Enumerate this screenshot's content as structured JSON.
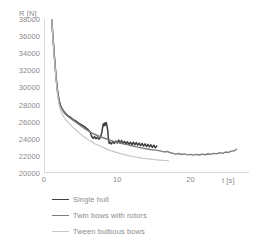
{
  "chart_data": {
    "type": "line",
    "title": "",
    "xlabel": "t [s]",
    "ylabel": "R [N]",
    "xlim": [
      0,
      28
    ],
    "ylim": [
      20000,
      38000
    ],
    "xticks": [
      0,
      10,
      20
    ],
    "yticks": [
      20000,
      22000,
      24000,
      26000,
      28000,
      30000,
      32000,
      34000,
      36000,
      38000
    ],
    "ytick_labels": [
      "20000",
      "22000",
      "24000",
      "26000",
      "28000",
      "30000",
      "32000",
      "34000",
      "36000",
      "38000"
    ],
    "xtick_labels": [
      "0",
      "10",
      "20"
    ],
    "grid": false,
    "legend_position": "bottom-left",
    "series": [
      {
        "name": "Single hull",
        "color": "#3f3f3f",
        "width": 1.5,
        "points": [
          [
            1.05,
            38000
          ],
          [
            1.25,
            35600
          ],
          [
            1.45,
            33300
          ],
          [
            1.65,
            31200
          ],
          [
            1.85,
            29600
          ],
          [
            2.05,
            28500
          ],
          [
            2.3,
            27800
          ],
          [
            2.6,
            27350
          ],
          [
            2.9,
            27000
          ],
          [
            3.2,
            26750
          ],
          [
            3.6,
            26500
          ],
          [
            4.0,
            26250
          ],
          [
            4.4,
            26050
          ],
          [
            4.8,
            25800
          ],
          [
            5.2,
            25600
          ],
          [
            5.6,
            25350
          ],
          [
            6.0,
            25100
          ],
          [
            6.3,
            24800
          ],
          [
            6.5,
            24300
          ],
          [
            6.7,
            24050
          ],
          [
            6.9,
            24250
          ],
          [
            7.1,
            24000
          ],
          [
            7.3,
            24200
          ],
          [
            7.5,
            23950
          ],
          [
            7.7,
            24150
          ],
          [
            7.9,
            24750
          ],
          [
            8.0,
            25300
          ],
          [
            8.1,
            25750
          ],
          [
            8.2,
            25500
          ],
          [
            8.3,
            25850
          ],
          [
            8.4,
            25600
          ],
          [
            8.5,
            25900
          ],
          [
            8.6,
            25500
          ],
          [
            8.7,
            25000
          ],
          [
            8.8,
            24000
          ],
          [
            8.9,
            23450
          ],
          [
            9.0,
            23600
          ],
          [
            9.2,
            23400
          ],
          [
            9.4,
            23700
          ],
          [
            9.6,
            23450
          ],
          [
            9.8,
            23750
          ],
          [
            10.0,
            23500
          ],
          [
            10.2,
            23850
          ],
          [
            10.4,
            23500
          ],
          [
            10.6,
            23800
          ],
          [
            10.8,
            23450
          ],
          [
            11.0,
            23700
          ],
          [
            11.2,
            23400
          ],
          [
            11.4,
            23650
          ],
          [
            11.6,
            23350
          ],
          [
            11.8,
            23600
          ],
          [
            12.0,
            23300
          ],
          [
            12.2,
            23600
          ],
          [
            12.4,
            23300
          ],
          [
            12.6,
            23550
          ],
          [
            12.8,
            23250
          ],
          [
            13.0,
            23500
          ],
          [
            13.2,
            23200
          ],
          [
            13.4,
            23450
          ],
          [
            13.6,
            23150
          ],
          [
            13.8,
            23400
          ],
          [
            14.0,
            23100
          ],
          [
            14.2,
            23350
          ],
          [
            14.4,
            23050
          ],
          [
            14.6,
            23300
          ],
          [
            14.8,
            23000
          ],
          [
            15.0,
            23250
          ],
          [
            15.2,
            22950
          ],
          [
            15.4,
            23150
          ]
        ]
      },
      {
        "name": "Twin bows with rotors",
        "color": "#7d7d7d",
        "width": 1.4,
        "points": [
          [
            1.05,
            38000
          ],
          [
            1.25,
            35500
          ],
          [
            1.45,
            33200
          ],
          [
            1.65,
            31100
          ],
          [
            1.85,
            29500
          ],
          [
            2.05,
            28400
          ],
          [
            2.3,
            27700
          ],
          [
            2.6,
            27250
          ],
          [
            2.9,
            26900
          ],
          [
            3.2,
            26650
          ],
          [
            3.6,
            26400
          ],
          [
            4.0,
            26150
          ],
          [
            4.4,
            25900
          ],
          [
            4.8,
            25650
          ],
          [
            5.2,
            25400
          ],
          [
            5.6,
            25150
          ],
          [
            6.0,
            24950
          ],
          [
            6.5,
            24700
          ],
          [
            7.0,
            24500
          ],
          [
            7.5,
            24300
          ],
          [
            8.0,
            24150
          ],
          [
            8.5,
            24000
          ],
          [
            9.0,
            23850
          ],
          [
            9.5,
            23700
          ],
          [
            10.0,
            23600
          ],
          [
            10.5,
            23480
          ],
          [
            11.0,
            23380
          ],
          [
            11.5,
            23280
          ],
          [
            12.0,
            23180
          ],
          [
            12.5,
            23080
          ],
          [
            13.0,
            23000
          ],
          [
            13.5,
            22900
          ],
          [
            14.0,
            22830
          ],
          [
            14.5,
            22750
          ],
          [
            15.0,
            22700
          ],
          [
            15.5,
            22640
          ],
          [
            16.0,
            22560
          ],
          [
            16.4,
            22460
          ],
          [
            16.8,
            22520
          ],
          [
            17.2,
            22400
          ],
          [
            17.6,
            22300
          ],
          [
            18.0,
            22200
          ],
          [
            18.4,
            22280
          ],
          [
            18.8,
            22160
          ],
          [
            19.2,
            22230
          ],
          [
            19.6,
            22120
          ],
          [
            20.0,
            22180
          ],
          [
            20.4,
            22090
          ],
          [
            20.8,
            22170
          ],
          [
            21.2,
            22100
          ],
          [
            21.6,
            22200
          ],
          [
            22.0,
            22130
          ],
          [
            22.4,
            22250
          ],
          [
            22.8,
            22180
          ],
          [
            23.2,
            22300
          ],
          [
            23.6,
            22230
          ],
          [
            24.0,
            22380
          ],
          [
            24.4,
            22300
          ],
          [
            24.8,
            22450
          ],
          [
            25.2,
            22400
          ],
          [
            25.6,
            22560
          ],
          [
            26.0,
            22600
          ],
          [
            26.3,
            22780
          ]
        ]
      },
      {
        "name": "Tween bulbous bows",
        "color": "#c2c2c2",
        "width": 1.1,
        "points": [
          [
            1.05,
            38000
          ],
          [
            1.25,
            35300
          ],
          [
            1.45,
            33000
          ],
          [
            1.65,
            30900
          ],
          [
            1.85,
            29200
          ],
          [
            2.05,
            28000
          ],
          [
            2.3,
            27250
          ],
          [
            2.6,
            26700
          ],
          [
            2.9,
            26300
          ],
          [
            3.2,
            26000
          ],
          [
            3.6,
            25650
          ],
          [
            4.0,
            25300
          ],
          [
            4.4,
            25000
          ],
          [
            4.8,
            24700
          ],
          [
            5.2,
            24400
          ],
          [
            5.6,
            24150
          ],
          [
            6.0,
            23900
          ],
          [
            6.5,
            23650
          ],
          [
            7.0,
            23400
          ],
          [
            7.5,
            23200
          ],
          [
            8.0,
            23000
          ],
          [
            8.5,
            22820
          ],
          [
            9.0,
            22650
          ],
          [
            9.5,
            22500
          ],
          [
            10.0,
            22380
          ],
          [
            10.5,
            22260
          ],
          [
            11.0,
            22150
          ],
          [
            11.5,
            22050
          ],
          [
            12.0,
            21960
          ],
          [
            12.5,
            21880
          ],
          [
            13.0,
            21800
          ],
          [
            13.5,
            21730
          ],
          [
            14.0,
            21670
          ],
          [
            14.5,
            21620
          ],
          [
            15.0,
            21570
          ],
          [
            15.5,
            21530
          ],
          [
            16.0,
            21490
          ],
          [
            16.5,
            21460
          ],
          [
            17.0,
            21430
          ]
        ]
      }
    ]
  },
  "axis": {
    "y_title": "R [N]",
    "x_title": "t [s]",
    "line_color": "#d9d9d9"
  },
  "legend": {
    "items": [
      {
        "label": "Single hull",
        "color": "#3f3f3f",
        "width": "1.6px"
      },
      {
        "label": "Twin bows with rotors",
        "color": "#7d7d7d",
        "width": "1.8px"
      },
      {
        "label": "Tween bulbous bows",
        "color": "#c8c8c8",
        "width": "1px"
      }
    ]
  }
}
